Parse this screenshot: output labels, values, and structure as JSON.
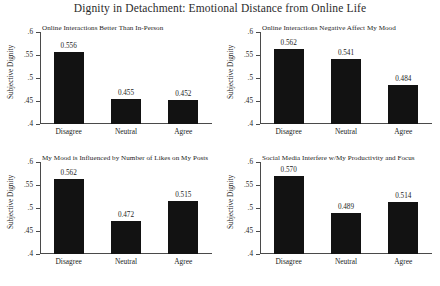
{
  "figure": {
    "title": "Dignity in Detachment: Emotional Distance from Online Life",
    "ylabel": "Subjective Dignity"
  },
  "axis": {
    "ticks": [
      ".6",
      ".55",
      ".5",
      ".45",
      ".4"
    ],
    "tick_values": [
      0.6,
      0.55,
      0.5,
      0.45,
      0.4
    ],
    "categories": [
      "Disagree",
      "Neutral",
      "Agree"
    ]
  },
  "panels": [
    {
      "title": "Online Interactions Better Than In-Person",
      "labels": [
        "0.556",
        "0.455",
        "0.452"
      ]
    },
    {
      "title": "Online Interactions Negative Affect My Mood",
      "labels": [
        "0.562",
        "0.541",
        "0.484"
      ]
    },
    {
      "title": "My Mood is Influenced by Number of Likes on My Posts",
      "labels": [
        "0.562",
        "0.472",
        "0.515"
      ]
    },
    {
      "title": "Social Media Interfere w/My Productivity and Focus",
      "labels": [
        "0.570",
        "0.489",
        "0.514"
      ]
    }
  ],
  "chart_data": {
    "type": "bar",
    "title": "Dignity in Detachment: Emotional Distance from Online Life",
    "xlabel": "",
    "ylabel": "Subjective Dignity",
    "ylim": [
      0.4,
      0.6
    ],
    "yticks": [
      0.4,
      0.45,
      0.5,
      0.55,
      0.6
    ],
    "ytick_labels": [
      ".4",
      ".45",
      ".5",
      ".55",
      ".6"
    ],
    "grid": false,
    "legend": "none",
    "layout": "2x2 small multiples",
    "categories": [
      "Disagree",
      "Neutral",
      "Agree"
    ],
    "panels": [
      {
        "title": "Online Interactions Better Than In-Person",
        "categories": [
          "Disagree",
          "Neutral",
          "Agree"
        ],
        "values": [
          0.556,
          0.455,
          0.452
        ],
        "labels": [
          "0.556",
          "0.455",
          "0.452"
        ]
      },
      {
        "title": "Online Interactions Negative Affect My Mood",
        "categories": [
          "Disagree",
          "Neutral",
          "Agree"
        ],
        "values": [
          0.562,
          0.541,
          0.484
        ],
        "labels": [
          "0.562",
          "0.541",
          "0.484"
        ]
      },
      {
        "title": "My Mood is Influenced by Number of Likes on My Posts",
        "categories": [
          "Disagree",
          "Neutral",
          "Agree"
        ],
        "values": [
          0.562,
          0.472,
          0.515
        ],
        "labels": [
          "0.562",
          "0.472",
          "0.515"
        ]
      },
      {
        "title": "Social Media Interfere w/My Productivity and Focus",
        "categories": [
          "Disagree",
          "Neutral",
          "Agree"
        ],
        "values": [
          0.57,
          0.489,
          0.514
        ],
        "labels": [
          "0.570",
          "0.489",
          "0.514"
        ]
      }
    ],
    "bar_color": "#121212"
  }
}
